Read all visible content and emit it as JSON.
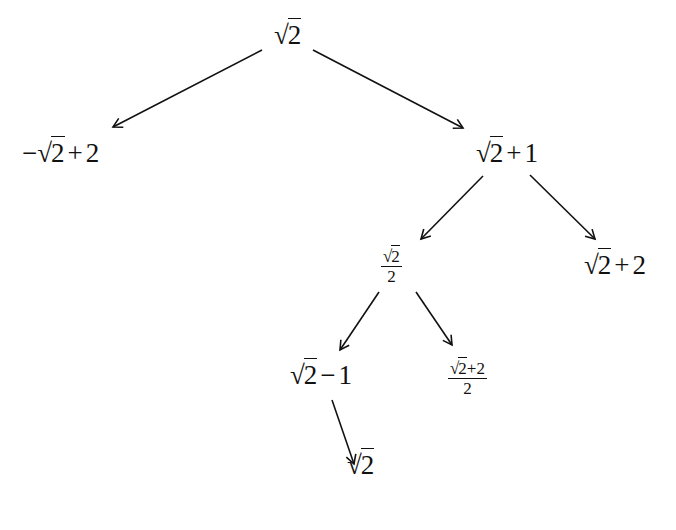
{
  "diagram": {
    "type": "tree",
    "nodes": [
      {
        "id": "root",
        "parts": {
          "sign": "√",
          "arg": "2",
          "rest": ""
        },
        "x": 274,
        "y": 22
      },
      {
        "id": "left",
        "parts": {
          "pre": "−",
          "sign": "√",
          "arg": "2",
          "op": "+",
          "rest": "2"
        },
        "x": 22,
        "y": 140
      },
      {
        "id": "right",
        "parts": {
          "sign": "√",
          "arg": "2",
          "op": "+",
          "rest": "1"
        },
        "x": 476,
        "y": 140
      },
      {
        "id": "rl",
        "parts": {
          "num_sign": "√",
          "num_arg": "2",
          "den": "2"
        },
        "x": 381,
        "y": 248
      },
      {
        "id": "rr",
        "parts": {
          "sign": "√",
          "arg": "2",
          "op": "+",
          "rest": "2"
        },
        "x": 584,
        "y": 252
      },
      {
        "id": "rll",
        "parts": {
          "sign": "√",
          "arg": "2",
          "op": "−",
          "rest": "1"
        },
        "x": 290,
        "y": 362
      },
      {
        "id": "rlr",
        "parts": {
          "num_sign": "√",
          "num_arg": "2",
          "num_rest": "+2",
          "den": "2"
        },
        "x": 448,
        "y": 360
      },
      {
        "id": "rlll",
        "parts": {
          "sign": "√",
          "arg": "2",
          "rest": ""
        },
        "x": 347,
        "y": 452
      }
    ],
    "edges": [
      {
        "from": "root",
        "to": "left",
        "x1": 262,
        "y1": 50,
        "x2": 113,
        "y2": 127
      },
      {
        "from": "root",
        "to": "right",
        "x1": 313,
        "y1": 50,
        "x2": 463,
        "y2": 128
      },
      {
        "from": "right",
        "to": "rl",
        "x1": 483,
        "y1": 176,
        "x2": 421,
        "y2": 239
      },
      {
        "from": "right",
        "to": "rr",
        "x1": 530,
        "y1": 175,
        "x2": 595,
        "y2": 239
      },
      {
        "from": "rl",
        "to": "rll",
        "x1": 379,
        "y1": 292,
        "x2": 340,
        "y2": 350
      },
      {
        "from": "rl",
        "to": "rlr",
        "x1": 416,
        "y1": 292,
        "x2": 452,
        "y2": 345
      },
      {
        "from": "rll",
        "to": "rlll",
        "x1": 332,
        "y1": 400,
        "x2": 354,
        "y2": 464
      }
    ],
    "stroke_color": "#111111"
  }
}
